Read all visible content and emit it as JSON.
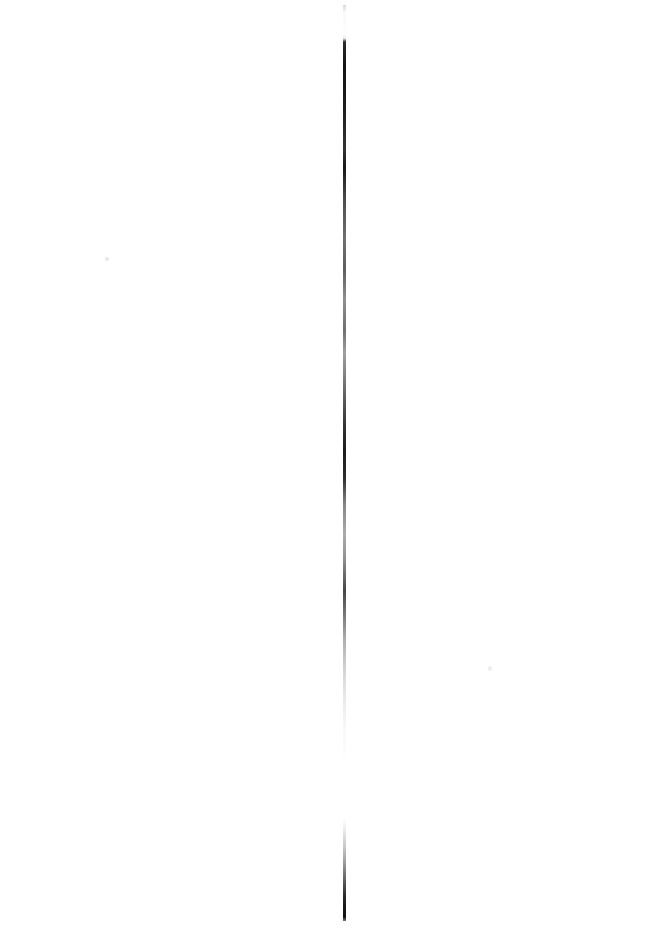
{
  "page": {
    "width": 664,
    "height": 928,
    "background_color": "#ffffff",
    "has_text": false
  },
  "marks": {
    "ink_color": "#0c0c0e",
    "items": [
      {
        "name": "upper-hairline-segment",
        "kind": "vertical-hairline",
        "x": 344,
        "y_start": 5,
        "y_end": 761,
        "length": 756,
        "thickness": 1.5,
        "orientation": "vertical",
        "density": "faint at the very top, very dark from about y=42 to y=200, medium gray through the middle with darker patches near y=480-540 and y=620-660, fading to near-white before the break"
      },
      {
        "name": "break-gap",
        "kind": "gap",
        "x": 344,
        "y_start": 761,
        "y_end": 820,
        "length": 59,
        "description": "blank white interruption separating the two stroke segments"
      },
      {
        "name": "lower-hairline-segment",
        "kind": "vertical-hairline",
        "x": 344,
        "y_start": 820,
        "y_end": 921,
        "length": 101,
        "thickness": 1.5,
        "orientation": "vertical",
        "density": "begins very faint and darkens steadily toward the bottom, nearly black at the end"
      },
      {
        "name": "speck-left",
        "kind": "speck",
        "x": 107,
        "y": 259,
        "size": 4,
        "density": "barely visible light gray"
      },
      {
        "name": "speck-right",
        "kind": "speck",
        "x": 490,
        "y": 668,
        "size": 4,
        "density": "barely visible light gray"
      }
    ]
  }
}
